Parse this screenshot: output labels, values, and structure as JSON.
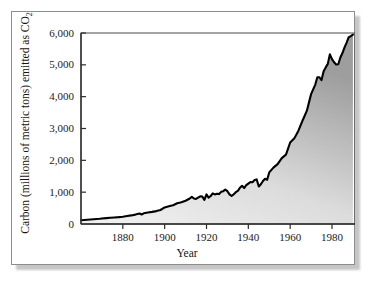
{
  "figure": {
    "frame_color": "#8d8d8d",
    "background": "#ffffff"
  },
  "chart_data": {
    "type": "area",
    "title": "",
    "subtitle": "",
    "xlabel": "Year",
    "ylabel": "Carbon (millions of metric tons) emitted as CO",
    "ylabel_subscript": "2",
    "xlim": [
      1860,
      1991
    ],
    "ylim": [
      0,
      6000
    ],
    "grid": false,
    "legend": null,
    "line_color": "#000000",
    "fill_color_top": "#9d9d9d",
    "fill_color_bottom": "#efefef",
    "xticks": [
      1880,
      1900,
      1920,
      1940,
      1960,
      1980
    ],
    "xtick_labels": [
      "1880",
      "1900",
      "1920",
      "1940",
      "1960",
      "1980"
    ],
    "yticks": [
      0,
      1000,
      2000,
      3000,
      4000,
      5000,
      6000
    ],
    "ytick_labels": [
      "0",
      "1,000",
      "2,000",
      "3,000",
      "4,000",
      "5,000",
      "6,000"
    ],
    "series": [
      {
        "name": "Global carbon emitted as CO2",
        "x": [
          1860,
          1863,
          1866,
          1869,
          1870,
          1872,
          1874,
          1876,
          1878,
          1880,
          1882,
          1884,
          1886,
          1888,
          1889,
          1890,
          1892,
          1894,
          1896,
          1898,
          1900,
          1902,
          1904,
          1906,
          1908,
          1910,
          1912,
          1913,
          1914,
          1915,
          1916,
          1917,
          1918,
          1919,
          1920,
          1921,
          1922,
          1923,
          1924,
          1925,
          1926,
          1927,
          1928,
          1929,
          1930,
          1931,
          1932,
          1933,
          1934,
          1935,
          1936,
          1937,
          1938,
          1939,
          1940,
          1941,
          1942,
          1943,
          1944,
          1945,
          1946,
          1947,
          1948,
          1949,
          1950,
          1952,
          1954,
          1956,
          1958,
          1960,
          1962,
          1964,
          1966,
          1968,
          1970,
          1972,
          1973,
          1974,
          1975,
          1976,
          1977,
          1978,
          1979,
          1980,
          1981,
          1982,
          1983,
          1984,
          1985,
          1986,
          1987,
          1988,
          1989,
          1990
        ],
        "y": [
          120,
          135,
          150,
          165,
          175,
          185,
          195,
          205,
          215,
          230,
          250,
          270,
          295,
          330,
          300,
          335,
          360,
          380,
          405,
          440,
          520,
          560,
          590,
          650,
          680,
          730,
          800,
          850,
          800,
          790,
          830,
          870,
          860,
          760,
          930,
          830,
          880,
          960,
          930,
          950,
          940,
          1010,
          1030,
          1080,
          1030,
          930,
          880,
          930,
          1000,
          1040,
          1140,
          1200,
          1130,
          1220,
          1270,
          1320,
          1310,
          1380,
          1400,
          1180,
          1250,
          1350,
          1420,
          1390,
          1620,
          1770,
          1880,
          2070,
          2180,
          2560,
          2690,
          2940,
          3260,
          3560,
          4080,
          4380,
          4610,
          4610,
          4520,
          4800,
          4920,
          5030,
          5330,
          5180,
          5080,
          5010,
          5020,
          5230,
          5370,
          5550,
          5700,
          5870,
          5900,
          5950
        ]
      }
    ]
  }
}
